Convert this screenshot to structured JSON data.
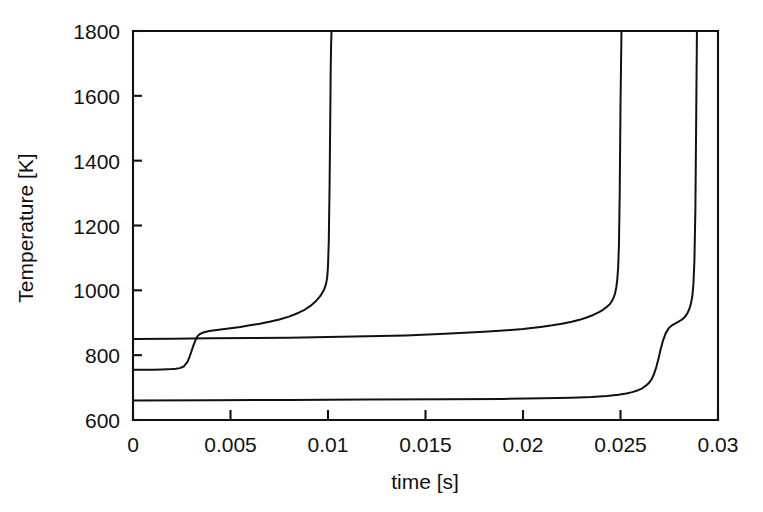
{
  "chart_data": {
    "type": "line",
    "title": "",
    "xlabel": "time [s]",
    "ylabel": "Temperature [K]",
    "xlim": [
      0,
      0.03
    ],
    "ylim": [
      600,
      1800
    ],
    "grid": false,
    "legend": "none",
    "xticks": [
      0,
      0.005,
      0.01,
      0.015,
      0.02,
      0.025,
      0.03
    ],
    "xtick_labels": [
      "0",
      "0.005",
      "0.01",
      "0.015",
      "0.02",
      "0.025",
      "0.03"
    ],
    "yticks": [
      600,
      800,
      1000,
      1200,
      1400,
      1600,
      1800
    ],
    "ytick_labels": [
      "600",
      "800",
      "1000",
      "1200",
      "1400",
      "1600",
      "1800"
    ],
    "series": [
      {
        "name": "curve-1-early-ignition",
        "ignition_time": 0.0101,
        "initial_temperature": 755,
        "x": [
          0.0,
          0.0005,
          0.001,
          0.0015,
          0.002,
          0.0022,
          0.0024,
          0.0026,
          0.0028,
          0.0029,
          0.003,
          0.0031,
          0.0032,
          0.0033,
          0.0034,
          0.0036,
          0.0038,
          0.004,
          0.0045,
          0.005,
          0.0055,
          0.006,
          0.0065,
          0.007,
          0.0075,
          0.008,
          0.0085,
          0.0088,
          0.0091,
          0.0094,
          0.0096,
          0.0098,
          0.0099,
          0.00996,
          0.01,
          0.01004,
          0.01008,
          0.01012,
          0.01014,
          0.01016,
          0.01018
        ],
        "y": [
          755,
          755,
          755,
          756,
          757,
          758,
          760,
          765,
          780,
          795,
          812,
          830,
          846,
          858,
          864,
          870,
          873,
          875,
          879,
          883,
          887,
          892,
          897,
          903,
          910,
          919,
          931,
          940,
          952,
          968,
          982,
          1002,
          1020,
          1040,
          1075,
          1150,
          1320,
          1560,
          1690,
          1760,
          1800
        ]
      },
      {
        "name": "curve-2-mid-ignition",
        "ignition_time": 0.0248,
        "initial_temperature": 850,
        "x": [
          0.0,
          0.002,
          0.004,
          0.006,
          0.008,
          0.01,
          0.012,
          0.014,
          0.016,
          0.018,
          0.019,
          0.02,
          0.021,
          0.0215,
          0.022,
          0.0225,
          0.0229,
          0.0233,
          0.0236,
          0.0239,
          0.0241,
          0.0243,
          0.02445,
          0.02455,
          0.02465,
          0.02472,
          0.02478,
          0.02483,
          0.02488,
          0.02492,
          0.02496,
          0.025,
          0.02505
        ],
        "y": [
          850,
          851,
          852,
          853,
          854,
          856,
          858,
          861,
          866,
          872,
          876,
          881,
          888,
          892,
          897,
          903,
          909,
          917,
          924,
          933,
          940,
          949,
          957,
          966,
          978,
          990,
          1008,
          1030,
          1070,
          1140,
          1300,
          1570,
          1800
        ]
      },
      {
        "name": "curve-3-late-ignition",
        "ignition_time": 0.0288,
        "initial_temperature": 660,
        "x": [
          0.0,
          0.004,
          0.008,
          0.012,
          0.016,
          0.019,
          0.021,
          0.0225,
          0.0235,
          0.0243,
          0.0249,
          0.0253,
          0.0256,
          0.0259,
          0.0261,
          0.0263,
          0.02645,
          0.0266,
          0.02672,
          0.02684,
          0.02695,
          0.02706,
          0.02718,
          0.02732,
          0.02748,
          0.02766,
          0.02784,
          0.028,
          0.02816,
          0.0283,
          0.02842,
          0.02852,
          0.0286,
          0.02868,
          0.02874,
          0.02879,
          0.02884,
          0.02888,
          0.02892
        ],
        "y": [
          660,
          661,
          662,
          663,
          664,
          665,
          667,
          669,
          671,
          674,
          678,
          682,
          686,
          692,
          697,
          706,
          714,
          726,
          742,
          764,
          790,
          818,
          845,
          868,
          884,
          893,
          899,
          904,
          910,
          918,
          928,
          941,
          956,
          980,
          1020,
          1090,
          1250,
          1520,
          1800
        ]
      }
    ]
  },
  "axes": {
    "xlabel": "time [s]",
    "ylabel": "Temperature [K]"
  }
}
